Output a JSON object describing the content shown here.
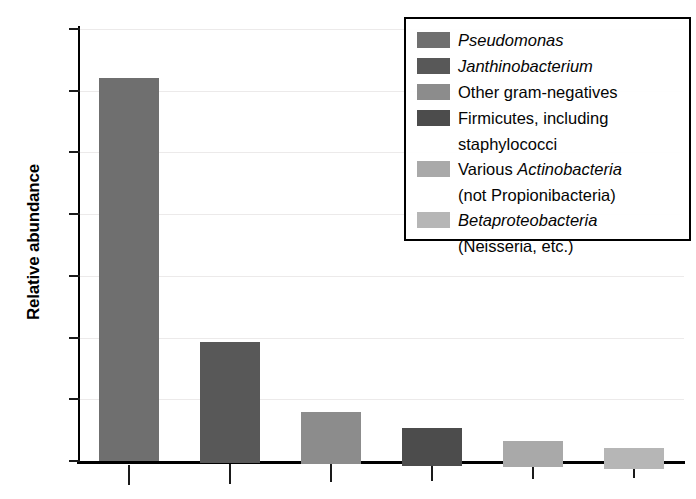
{
  "chart_data": {
    "type": "bar",
    "title": "",
    "xlabel": "",
    "ylabel": "Relative abundance",
    "ylim": [
      0,
      70
    ],
    "yticks": [
      0,
      10,
      20,
      30,
      40,
      50,
      60,
      70
    ],
    "grid": true,
    "legend_position": "top-right",
    "categories": [
      "Pseudomonas",
      "Janthinobacterium",
      "Other gram-negatives",
      "Firmicutes, including staphylococci",
      "Various Actinobacteria (not Propionibacteria)",
      "Betaproteobacteria (Neisseria, etc.)"
    ],
    "values": [
      62,
      19.5,
      8.5,
      6,
      4.2,
      3.3
    ],
    "colors": [
      "#6f6f6f",
      "#585858",
      "#8c8c8c",
      "#4c4c4c",
      "#a9a9a9",
      "#b6b6b6"
    ],
    "xtick_labels": [
      "",
      "",
      "",
      "",
      "",
      ""
    ]
  },
  "axes": {
    "y_title": "Relative abundance",
    "y_tick_labels": [
      "70",
      "60",
      "50",
      "40",
      "30",
      "20",
      "10",
      "0"
    ]
  },
  "legend": {
    "entries": [
      {
        "swatch_color": "#6f6f6f",
        "line1_prefix": "",
        "line1_italic": "Pseudomonas",
        "line1_suffix": "",
        "line2": ""
      },
      {
        "swatch_color": "#585858",
        "line1_prefix": "",
        "line1_italic": "Janthinobacterium",
        "line1_suffix": "",
        "line2": ""
      },
      {
        "swatch_color": "#8c8c8c",
        "line1_prefix": "Other gram-negatives",
        "line1_italic": "",
        "line1_suffix": "",
        "line2": ""
      },
      {
        "swatch_color": "#4c4c4c",
        "line1_prefix": "Firmicutes, including",
        "line1_italic": "",
        "line1_suffix": "",
        "line2": "staphylococci"
      },
      {
        "swatch_color": "#a9a9a9",
        "line1_prefix": "Various ",
        "line1_italic": "Actinobacteria",
        "line1_suffix": "",
        "line2_prefix": "(not ",
        "line2_italic": "Propionibacteria",
        "line2_suffix": ")"
      },
      {
        "swatch_color": "#b6b6b6",
        "line1_prefix": "",
        "line1_italic": "Betaproteobacteria",
        "line1_suffix": "",
        "line2_prefix": "(",
        "line2_italic": "Neisseria",
        "line2_suffix": ", etc.)"
      }
    ]
  }
}
